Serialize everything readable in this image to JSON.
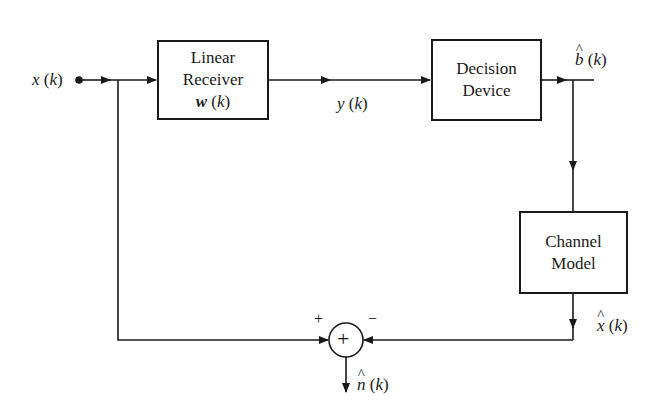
{
  "diagram": {
    "type": "block-diagram",
    "input": {
      "label_var": "x",
      "label_arg": "(k)"
    },
    "blocks": [
      {
        "id": "linear-receiver",
        "lines": [
          "Linear",
          "Receiver"
        ],
        "param_var": "w",
        "param_arg": "(k)"
      },
      {
        "id": "decision-device",
        "lines": [
          "Decision",
          "Device"
        ]
      },
      {
        "id": "channel-model",
        "lines": [
          "Channel",
          "Model"
        ]
      }
    ],
    "signals": {
      "y": {
        "var": "y",
        "arg": "(k)"
      },
      "b_hat": {
        "var": "b",
        "arg": "(k)",
        "hat": true
      },
      "x_hat": {
        "var": "x",
        "arg": "(k)",
        "hat": true
      },
      "n_hat": {
        "var": "n",
        "arg": "(k)",
        "hat": true
      }
    },
    "summer": {
      "symbol": "+",
      "plus_sign": "+",
      "minus_sign": "−"
    },
    "colors": {
      "stroke": "#1a1a1a",
      "background": "#ffffff"
    }
  }
}
